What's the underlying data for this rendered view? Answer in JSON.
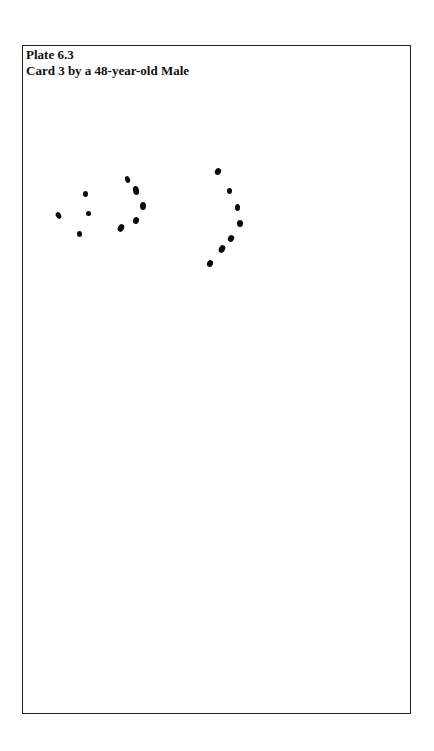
{
  "plate": {
    "number": "Plate 6.3",
    "caption": "Card 3 by a 48-year-old Male"
  },
  "drawing": {
    "description": "Bender-Gestalt style reproduction of dot-pattern Card 3",
    "dots": [
      {
        "x": 58,
        "y": 215,
        "w": 5,
        "h": 7,
        "r": -30
      },
      {
        "x": 85,
        "y": 194,
        "w": 5,
        "h": 6,
        "r": 0
      },
      {
        "x": 88,
        "y": 213,
        "w": 5,
        "h": 5,
        "r": 0
      },
      {
        "x": 79,
        "y": 234,
        "w": 5,
        "h": 6,
        "r": 0
      },
      {
        "x": 127,
        "y": 179,
        "w": 5,
        "h": 7,
        "r": -20
      },
      {
        "x": 136,
        "y": 190,
        "w": 6,
        "h": 9,
        "r": -10
      },
      {
        "x": 143,
        "y": 206,
        "w": 6,
        "h": 8,
        "r": 0
      },
      {
        "x": 136,
        "y": 220,
        "w": 6,
        "h": 7,
        "r": 20
      },
      {
        "x": 121,
        "y": 228,
        "w": 6,
        "h": 8,
        "r": 30
      },
      {
        "x": 218,
        "y": 171,
        "w": 6,
        "h": 7,
        "r": 30
      },
      {
        "x": 229,
        "y": 191,
        "w": 5,
        "h": 6,
        "r": 0
      },
      {
        "x": 237,
        "y": 207,
        "w": 5,
        "h": 7,
        "r": 0
      },
      {
        "x": 240,
        "y": 223,
        "w": 6,
        "h": 7,
        "r": 0
      },
      {
        "x": 231,
        "y": 238,
        "w": 6,
        "h": 7,
        "r": 30
      },
      {
        "x": 222,
        "y": 249,
        "w": 6,
        "h": 8,
        "r": 30
      },
      {
        "x": 210,
        "y": 263,
        "w": 6,
        "h": 7,
        "r": 20
      }
    ]
  }
}
